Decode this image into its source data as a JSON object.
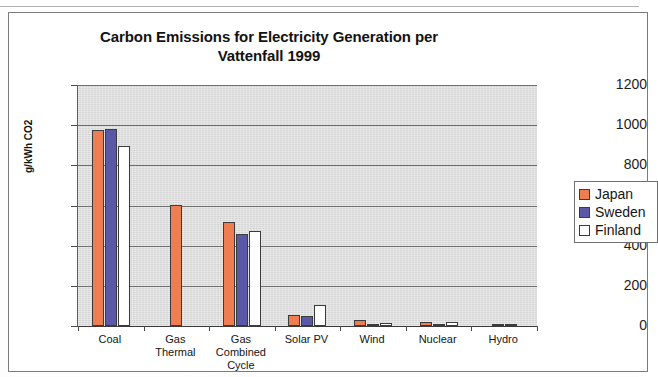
{
  "chart_data": {
    "type": "bar",
    "title": "Carbon Emissions for Electricity Generation per Vattenfall 1999",
    "title_line1": "Carbon Emissions for Electricity Generation per",
    "title_line2": "Vattenfall 1999",
    "xlabel": "",
    "ylabel": "g/kWh CO2",
    "ylim": [
      0,
      1200
    ],
    "ytick_labels": [
      "1200",
      "1000",
      "800",
      "600",
      "400",
      "200",
      "0"
    ],
    "ytick_values": [
      1200,
      1000,
      800,
      600,
      400,
      200,
      0
    ],
    "grid": true,
    "legend_position": "right",
    "categories": [
      "Coal",
      "Gas Thermal",
      "Gas Combined Cycle",
      "Solar PV",
      "Wind",
      "Nuclear",
      "Hydro"
    ],
    "category_labels": [
      "Coal",
      "Gas\nThermal",
      "Gas\nCombined\nCycle",
      "Solar PV",
      "Wind",
      "Nuclear",
      "Hydro"
    ],
    "series": [
      {
        "name": "Japan",
        "color": "#ee7d52",
        "values": [
          975,
          605,
          519,
          53,
          29,
          22,
          11
        ]
      },
      {
        "name": "Sweden",
        "color": "#5b58a8",
        "values": [
          980,
          0,
          460,
          50,
          6,
          6,
          3
        ]
      },
      {
        "name": "Finland",
        "color": "#ffffff",
        "values": [
          894,
          0,
          472,
          104,
          14,
          20,
          0
        ]
      }
    ]
  },
  "legend": {
    "items": [
      {
        "label": "Japan"
      },
      {
        "label": "Sweden"
      },
      {
        "label": "Finland"
      }
    ]
  },
  "colors": {
    "japan": "#ee7d52",
    "sweden": "#5b58a8",
    "finland": "#ffffff",
    "plot_background": "#d6d6d6",
    "gridline": "#5c5c5c"
  }
}
